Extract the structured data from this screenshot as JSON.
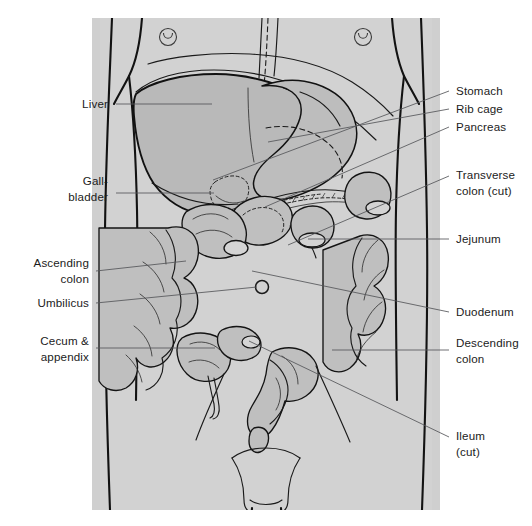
{
  "figure": {
    "panel": {
      "x": 92,
      "y": 18,
      "width": 348,
      "height": 492,
      "background_color": "#cfcfcf",
      "page_background_color": "#ffffff"
    },
    "colors": {
      "panel_gray": "#cfcfcf",
      "organ_gray": "#bdbdbd",
      "liver_gray": "#b9b9b9",
      "outline_black": "#121212",
      "leader_gray": "#55565a",
      "label_text": "#1b1b1b"
    }
  },
  "labels_left": [
    {
      "id": "liver",
      "lines": [
        "Liver"
      ],
      "text_x": 108,
      "text_y": 108,
      "leader": [
        [
          116,
          104
        ],
        [
          212,
          104
        ]
      ]
    },
    {
      "id": "gallbladder",
      "lines": [
        "Gall-",
        "bladder"
      ],
      "text_x": 108,
      "text_y": 185,
      "leader": [
        [
          116,
          193
        ],
        [
          214,
          193
        ]
      ]
    },
    {
      "id": "ascending-colon",
      "lines": [
        "Ascending",
        "colon"
      ],
      "text_x": 89,
      "text_y": 267,
      "leader": [
        [
          96,
          271
        ],
        [
          186,
          261
        ]
      ]
    },
    {
      "id": "umbilicus",
      "lines": [
        "Umbilicus"
      ],
      "text_x": 89,
      "text_y": 307,
      "leader": [
        [
          96,
          303
        ],
        [
          257,
          287
        ]
      ]
    },
    {
      "id": "cecum-appendix",
      "lines": [
        "Cecum &",
        "appendix"
      ],
      "text_x": 89,
      "text_y": 345,
      "leader": [
        [
          96,
          348
        ],
        [
          215,
          348
        ]
      ]
    }
  ],
  "labels_right": [
    {
      "id": "stomach",
      "lines": [
        "Stomach"
      ],
      "text_x": 456,
      "text_y": 95,
      "leader": [
        [
          449,
          91
        ],
        [
          213,
          180
        ]
      ]
    },
    {
      "id": "rib-cage",
      "lines": [
        "Rib cage"
      ],
      "text_x": 456,
      "text_y": 113,
      "leader": [
        [
          449,
          109
        ],
        [
          268,
          142
        ]
      ]
    },
    {
      "id": "pancreas",
      "lines": [
        "Pancreas"
      ],
      "text_x": 456,
      "text_y": 131,
      "leader": [
        [
          449,
          127
        ],
        [
          265,
          207
        ]
      ]
    },
    {
      "id": "transverse-colon",
      "lines": [
        "Transverse",
        "colon (cut)"
      ],
      "text_x": 456,
      "text_y": 179,
      "leader": [
        [
          449,
          176
        ],
        [
          288,
          245
        ]
      ]
    },
    {
      "id": "jejunum",
      "lines": [
        "Jejunum"
      ],
      "text_x": 456,
      "text_y": 243,
      "leader": [
        [
          449,
          239
        ],
        [
          308,
          239
        ]
      ]
    },
    {
      "id": "duodenum",
      "lines": [
        "Duodenum"
      ],
      "text_x": 456,
      "text_y": 316,
      "leader": [
        [
          449,
          312
        ],
        [
          252,
          271
        ]
      ]
    },
    {
      "id": "descending-colon",
      "lines": [
        "Descending",
        "colon"
      ],
      "text_x": 456,
      "text_y": 347,
      "leader": [
        [
          449,
          350
        ],
        [
          332,
          350
        ]
      ]
    },
    {
      "id": "ileum-cut",
      "lines": [
        "Ileum",
        "(cut)"
      ],
      "text_x": 456,
      "text_y": 440,
      "leader": [
        [
          449,
          437
        ],
        [
          249,
          341
        ]
      ]
    }
  ],
  "anatomy_parts": [
    "liver",
    "gallbladder",
    "stomach",
    "pancreas",
    "duodenum",
    "jejunum",
    "ileum",
    "ascending colon",
    "transverse colon",
    "descending colon",
    "cecum",
    "appendix",
    "rib cage",
    "umbilicus",
    "nipple markers"
  ]
}
